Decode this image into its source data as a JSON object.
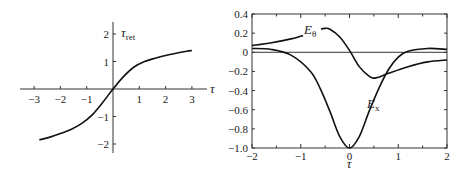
{
  "chart_data": [
    {
      "type": "line",
      "title": "",
      "xlabel": "τ",
      "ylabel": "τ_ret",
      "xlim": [
        -3.3,
        3.6
      ],
      "ylim": [
        -2.4,
        2.4
      ],
      "grid": false,
      "x_ticks": [
        "−3",
        "−2",
        "−1",
        "1",
        "2",
        "3"
      ],
      "y_ticks": [
        "2",
        "1",
        "−1",
        "−2"
      ],
      "series": [
        {
          "name": "τ_ret",
          "x": [
            -2.8,
            -2.4,
            -2.0,
            -1.6,
            -1.2,
            -0.8,
            -0.4,
            0.0,
            0.4,
            0.8,
            1.2,
            1.6,
            2.0,
            2.4,
            2.8,
            3.0
          ],
          "y": [
            -1.85,
            -1.75,
            -1.62,
            -1.47,
            -1.26,
            -0.95,
            -0.5,
            0.0,
            0.45,
            0.8,
            1.0,
            1.12,
            1.22,
            1.3,
            1.37,
            1.4
          ]
        }
      ]
    },
    {
      "type": "line",
      "title": "",
      "xlabel": "τ",
      "ylabel": "",
      "xlim": [
        -2,
        2
      ],
      "ylim": [
        -1.0,
        0.4
      ],
      "grid": false,
      "x_ticks": [
        "−2",
        "−1",
        "0",
        "1",
        "2"
      ],
      "y_ticks": [
        "0.4",
        "0.2",
        "0",
        "−0.2",
        "−0.4",
        "−0.6",
        "−0.8",
        "−1.0"
      ],
      "series": [
        {
          "name": "E_θ",
          "x": [
            -2.0,
            -1.6,
            -1.2,
            -0.8,
            -0.6,
            -0.5,
            -0.4,
            -0.2,
            0.0,
            0.2,
            0.4,
            0.5,
            0.6,
            0.8,
            1.2,
            1.6,
            2.0
          ],
          "y": [
            0.07,
            0.1,
            0.14,
            0.2,
            0.24,
            0.25,
            0.24,
            0.16,
            0.02,
            -0.15,
            -0.25,
            -0.27,
            -0.26,
            -0.22,
            -0.15,
            -0.1,
            -0.08
          ]
        },
        {
          "name": "E_x",
          "x": [
            -2.0,
            -1.6,
            -1.2,
            -0.8,
            -0.6,
            -0.4,
            -0.2,
            0.0,
            0.2,
            0.4,
            0.6,
            0.8,
            1.0,
            1.2,
            1.6,
            2.0
          ],
          "y": [
            0.04,
            0.03,
            -0.03,
            -0.2,
            -0.38,
            -0.62,
            -0.88,
            -1.0,
            -0.88,
            -0.62,
            -0.38,
            -0.18,
            -0.05,
            0.01,
            0.04,
            0.03
          ]
        }
      ],
      "annotations": [
        "E_θ",
        "E_x"
      ]
    }
  ],
  "labels": {
    "left_ylabel_main": "τ",
    "left_ylabel_sub": "ret",
    "left_xlabel": "τ",
    "right_xlabel": "τ",
    "e_theta_main": "E",
    "e_theta_sub": "θ",
    "e_x_main": "E",
    "e_x_sub": "x"
  }
}
